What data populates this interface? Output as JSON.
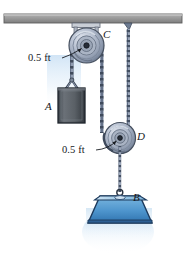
{
  "figure": {
    "background_color": "#ffffff",
    "labels": {
      "pulley_top": "C",
      "pulley_bottom": "D",
      "block_a": "A",
      "weight_b": "B",
      "radius_top": "0.5 ft",
      "radius_bottom": "0.5 ft"
    },
    "colors": {
      "ceiling_fill": "#9a9a9a",
      "ceiling_edge": "#5e5e5e",
      "pulley_body": "#b9c2d2",
      "pulley_edge": "#4a5568",
      "pulley_hub": "#2c3340",
      "chain_dark": "#3f4a5c",
      "chain_light": "#aab4c6",
      "block_a_fill": "#5d6268",
      "block_a_edge": "#232a33",
      "weight_b_fill": "#5a9fd4",
      "weight_b_top": "#a8cfe8",
      "weight_b_edge": "#1d3a5c",
      "label_text": "#16181c",
      "leader_line": "#1a1d22"
    },
    "elements": [
      {
        "name": "ceiling-beam",
        "kind": "support"
      },
      {
        "name": "pulley-c",
        "kind": "fixed-pulley",
        "radius_label": "0.5 ft"
      },
      {
        "name": "pulley-d",
        "kind": "movable-pulley",
        "radius_label": "0.5 ft"
      },
      {
        "name": "block-a",
        "kind": "hanging-block"
      },
      {
        "name": "weight-b",
        "kind": "hanging-weight"
      },
      {
        "name": "chain-a",
        "kind": "chain"
      },
      {
        "name": "chain-cd",
        "kind": "chain"
      },
      {
        "name": "chain-ceiling-d",
        "kind": "chain"
      },
      {
        "name": "cable-b",
        "kind": "cable"
      }
    ]
  }
}
